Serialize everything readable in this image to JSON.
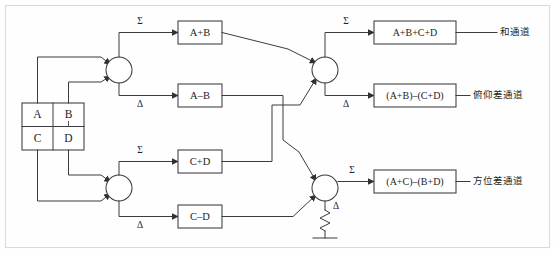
{
  "diagram": {
    "background_color": "#fefefe",
    "line_color": "#3b3b42",
    "frame_color": "#d9d9dd",
    "quadrant_feed": {
      "name": "four-quadrant-feed",
      "cells": [
        {
          "id": "A",
          "label": "A"
        },
        {
          "id": "B",
          "label": "B"
        },
        {
          "id": "C",
          "label": "C"
        },
        {
          "id": "D",
          "label": "D"
        }
      ]
    },
    "junctions": [
      {
        "id": "hybrid-top-left",
        "sum_label": "Σ",
        "diff_label": "Δ"
      },
      {
        "id": "hybrid-bottom-left",
        "sum_label": "Σ",
        "diff_label": "Δ"
      },
      {
        "id": "hybrid-top-right",
        "sum_label": "Σ",
        "diff_label": "Δ"
      },
      {
        "id": "hybrid-bottom-right",
        "sum_label": "Σ",
        "diff_label": "Δ"
      }
    ],
    "stage1_boxes": [
      {
        "id": "a-plus-b",
        "label": "A+B"
      },
      {
        "id": "a-minus-b",
        "label": "A–B"
      },
      {
        "id": "c-plus-d",
        "label": "C+D"
      },
      {
        "id": "c-minus-d",
        "label": "C–D"
      }
    ],
    "stage2_boxes": [
      {
        "id": "sum-channel",
        "label": "A+B+C+D",
        "channel": "和通道"
      },
      {
        "id": "elevation-difference-channel",
        "label": "(A+B)–(C+D)",
        "channel": "俯仰差通道"
      },
      {
        "id": "azimuth-difference-channel",
        "label": "(A+C)–(B+D)",
        "channel": "方位差通道"
      }
    ],
    "termination": {
      "id": "resistive-termination",
      "name": "resistor-to-ground",
      "port_label": "Δ"
    }
  }
}
